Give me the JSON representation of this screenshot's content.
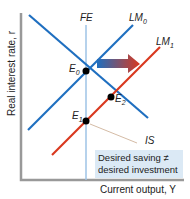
{
  "axes": {
    "y_label": "Real interest rate, r",
    "x_label": "Current output, Y"
  },
  "curves": {
    "fe": "FE",
    "lm0": "LM",
    "lm0_sub": "0",
    "lm1": "LM",
    "lm1_sub": "1",
    "is": "IS"
  },
  "points": {
    "e0": "E",
    "e0_sub": "0",
    "e1": "E",
    "e1_sub": "1",
    "e2": "E",
    "e2_sub": "2"
  },
  "note": {
    "line1": "Desired saving ≠",
    "line2": "desired investment"
  },
  "colors": {
    "blue": "#1f6fc0",
    "red": "#d9381e",
    "fe": "#9ec3e6",
    "axis": "#999999",
    "note_bg": "#dbe9f5"
  }
}
